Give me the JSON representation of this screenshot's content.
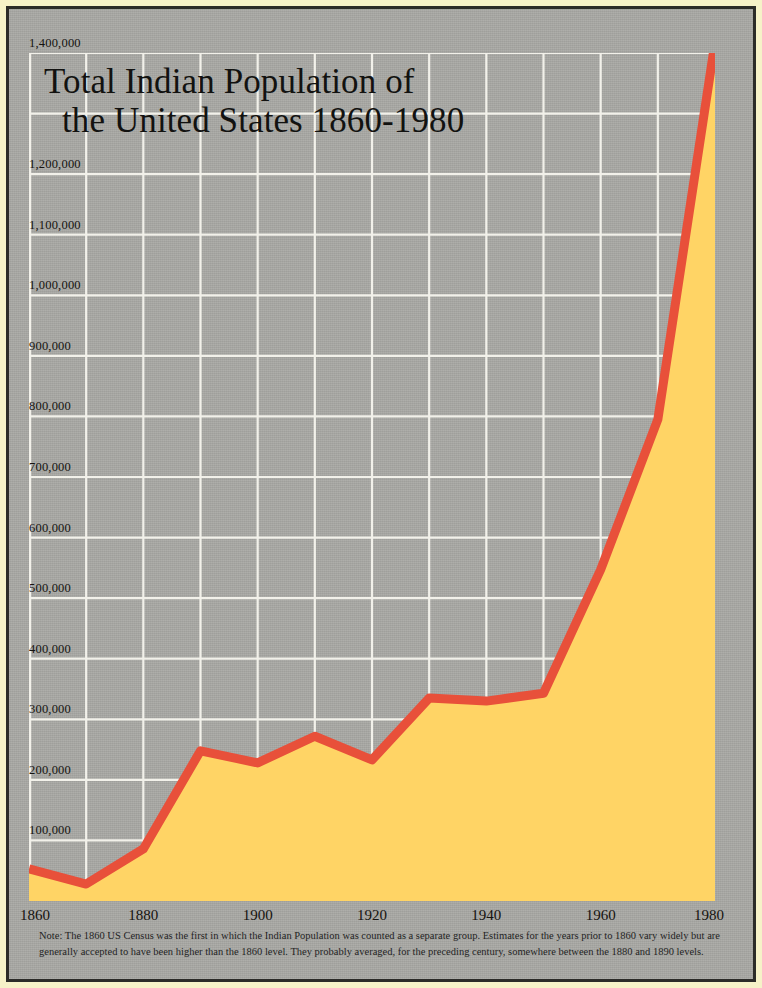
{
  "poster": {
    "background_color": "#f6f2c8",
    "board_color": "#a9a9a5",
    "frame_color": "#2b2b28"
  },
  "title": {
    "line1": "Total Indian Population of",
    "line2": "the United States 1860-1980"
  },
  "note": {
    "text": "Note: The 1860 US Census was the first in which the Indian Population was counted as a separate group. Estimates for the years prior to 1860 vary widely but are generally accepted to have been higher than the 1860 level. They probably averaged, for the preceding century, somewhere between the 1880 and 1890 levels."
  },
  "chart_data": {
    "type": "area",
    "title": "Total Indian Population of the United States 1860-1980",
    "xlabel": "",
    "ylabel": "",
    "x": [
      1860,
      1870,
      1880,
      1890,
      1900,
      1910,
      1920,
      1930,
      1940,
      1950,
      1960,
      1970,
      1980
    ],
    "values": [
      53000,
      28000,
      86000,
      248000,
      228000,
      272000,
      233000,
      335000,
      330000,
      343000,
      547000,
      795000,
      1418000
    ],
    "xlim": [
      1860,
      1980
    ],
    "ylim": [
      0,
      1400000
    ],
    "xtick_labels": [
      "1860",
      "1880",
      "1900",
      "1920",
      "1940",
      "1960",
      "1980"
    ],
    "xtick_values": [
      1860,
      1880,
      1900,
      1920,
      1940,
      1960,
      1980
    ],
    "xgrid_values": [
      1860,
      1870,
      1880,
      1890,
      1900,
      1910,
      1920,
      1930,
      1940,
      1950,
      1960,
      1970,
      1980
    ],
    "ytick_labels": [
      "1,400,000",
      "1,200,000",
      "1,100,000",
      "1,000,000",
      "900,000",
      "800,000",
      "700,000",
      "600,000",
      "500,000",
      "400,000",
      "300,000",
      "200,000",
      "100,000"
    ],
    "ytick_values": [
      1400000,
      1200000,
      1100000,
      1000000,
      900000,
      800000,
      700000,
      600000,
      500000,
      400000,
      300000,
      200000,
      100000
    ],
    "ygrid_values": [
      1400000,
      1300000,
      1200000,
      1100000,
      1000000,
      900000,
      800000,
      700000,
      600000,
      500000,
      400000,
      300000,
      200000,
      100000
    ],
    "grid": true,
    "grid_color": "#f2f1ea",
    "legend": "none",
    "line_color": "#e8503a",
    "fill_color": "#ffd465",
    "line_width": 9,
    "plot_background": "#a9a9a5"
  }
}
